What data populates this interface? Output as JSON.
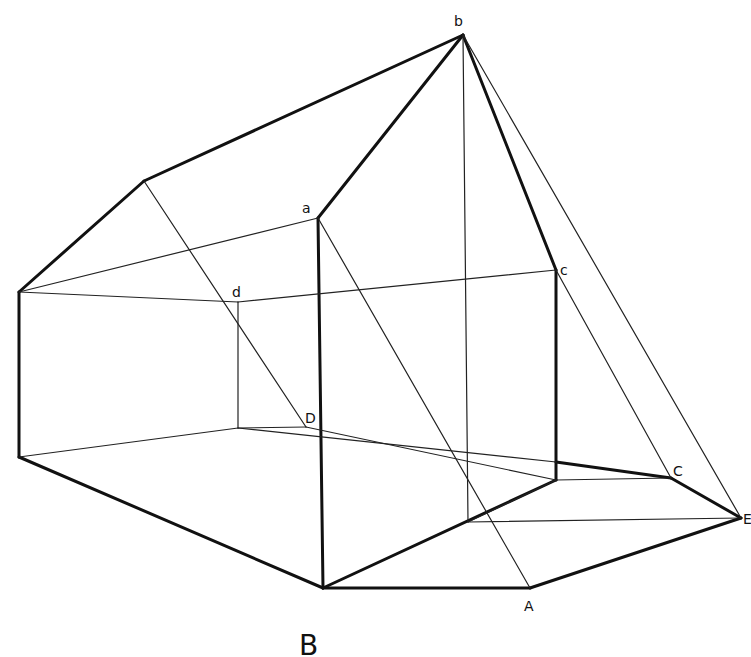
{
  "figure": {
    "caption": "B",
    "labels": {
      "a": "a",
      "b": "b",
      "c": "c",
      "d": "d",
      "D": "D",
      "C": "C",
      "E": "E",
      "A": "A"
    },
    "line_color": "#111111",
    "background": "#ffffff"
  }
}
